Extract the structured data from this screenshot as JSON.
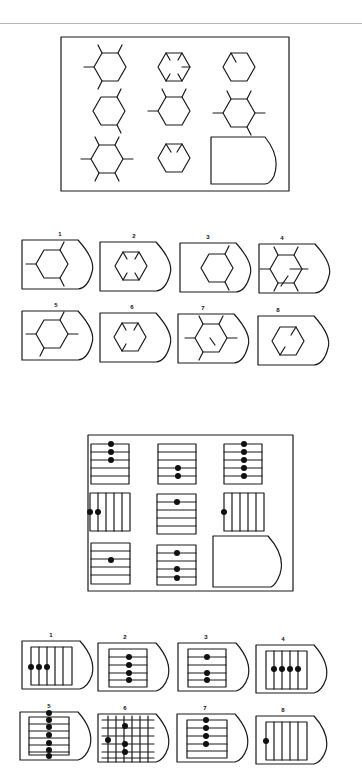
{
  "problem1": {
    "title": "hexagon matrix",
    "matrix_cells": [
      {
        "row": 1,
        "col": 1,
        "figure": "hexagon-4-spokes"
      },
      {
        "row": 1,
        "col": 2,
        "figure": "hexagon-5-inner-ticks"
      },
      {
        "row": 1,
        "col": 3,
        "figure": "hexagon-1-inner-tick"
      },
      {
        "row": 2,
        "col": 1,
        "figure": "hexagon-2-spokes"
      },
      {
        "row": 2,
        "col": 2,
        "figure": "hexagon-3-spokes"
      },
      {
        "row": 2,
        "col": 3,
        "figure": "hexagon-6-spokes"
      },
      {
        "row": 3,
        "col": 1,
        "figure": "hexagon-8-spokes"
      },
      {
        "row": 3,
        "col": 2,
        "figure": "hexagon-2-inner-ticks"
      },
      {
        "row": 3,
        "col": 3,
        "figure": "blank-answer-slot"
      }
    ],
    "options": [
      {
        "label": "1"
      },
      {
        "label": "2"
      },
      {
        "label": "3"
      },
      {
        "label": "4"
      },
      {
        "label": "5"
      },
      {
        "label": "6"
      },
      {
        "label": "7"
      },
      {
        "label": "8"
      }
    ]
  },
  "problem2": {
    "title": "lines and dots matrix",
    "matrix_cells": [
      {
        "row": 1,
        "col": 1,
        "figure": "horizontal-lines-3-dots-top"
      },
      {
        "row": 1,
        "col": 2,
        "figure": "horizontal-lines-2-dots-bottom"
      },
      {
        "row": 1,
        "col": 3,
        "figure": "horizontal-lines-5-dots"
      },
      {
        "row": 2,
        "col": 1,
        "figure": "vertical-lines-2-dots-left"
      },
      {
        "row": 2,
        "col": 2,
        "figure": "horizontal-lines-1-dot-top"
      },
      {
        "row": 2,
        "col": 3,
        "figure": "vertical-lines-1-dot-left"
      },
      {
        "row": 3,
        "col": 1,
        "figure": "horizontal-lines-1-dot-middle"
      },
      {
        "row": 3,
        "col": 2,
        "figure": "horizontal-lines-3-dots"
      },
      {
        "row": 3,
        "col": 3,
        "figure": "blank-answer-slot"
      }
    ],
    "options": [
      {
        "label": "1"
      },
      {
        "label": "2"
      },
      {
        "label": "3"
      },
      {
        "label": "4"
      },
      {
        "label": "5"
      },
      {
        "label": "6"
      },
      {
        "label": "7"
      },
      {
        "label": "8"
      }
    ]
  }
}
